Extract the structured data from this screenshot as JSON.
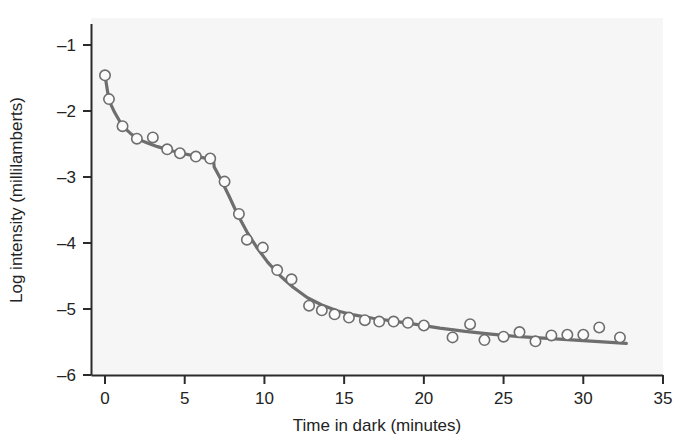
{
  "chart_data": {
    "type": "scatter",
    "title": "",
    "subtitle": "",
    "xlabel": "Time in dark (minutes)",
    "ylabel": "Log intensity (millilamberts)",
    "xlim": [
      0,
      35
    ],
    "ylim": [
      -6,
      -0.6
    ],
    "xticks": [
      0,
      5,
      10,
      15,
      20,
      25,
      30,
      35
    ],
    "xtick_labels": [
      "0",
      "5",
      "10",
      "15",
      "20",
      "25",
      "30",
      "35"
    ],
    "yticks": [
      -1,
      -2,
      -3,
      -4,
      -5,
      -6
    ],
    "ytick_labels": [
      "–1",
      "–2",
      "–3",
      "–4",
      "–5",
      "–6"
    ],
    "grid": false,
    "legend": null,
    "legend_position": "none",
    "annotations": [],
    "series": [
      {
        "name": "Measured threshold",
        "marker": "open-circle",
        "color": "#6e6e6e",
        "points": [
          {
            "x": 0.0,
            "y": -1.46
          },
          {
            "x": 0.25,
            "y": -1.82
          },
          {
            "x": 1.1,
            "y": -2.23
          },
          {
            "x": 2.0,
            "y": -2.42
          },
          {
            "x": 3.0,
            "y": -2.4
          },
          {
            "x": 3.9,
            "y": -2.58
          },
          {
            "x": 4.7,
            "y": -2.64
          },
          {
            "x": 5.7,
            "y": -2.69
          },
          {
            "x": 6.6,
            "y": -2.72
          },
          {
            "x": 7.5,
            "y": -3.07
          },
          {
            "x": 8.4,
            "y": -3.56
          },
          {
            "x": 8.9,
            "y": -3.95
          },
          {
            "x": 9.9,
            "y": -4.07
          },
          {
            "x": 10.8,
            "y": -4.41
          },
          {
            "x": 11.7,
            "y": -4.55
          },
          {
            "x": 12.8,
            "y": -4.95
          },
          {
            "x": 13.6,
            "y": -5.02
          },
          {
            "x": 14.4,
            "y": -5.08
          },
          {
            "x": 15.3,
            "y": -5.13
          },
          {
            "x": 16.3,
            "y": -5.17
          },
          {
            "x": 17.2,
            "y": -5.19
          },
          {
            "x": 18.1,
            "y": -5.19
          },
          {
            "x": 19.0,
            "y": -5.21
          },
          {
            "x": 20.0,
            "y": -5.25
          },
          {
            "x": 21.8,
            "y": -5.43
          },
          {
            "x": 22.9,
            "y": -5.23
          },
          {
            "x": 23.8,
            "y": -5.47
          },
          {
            "x": 25.0,
            "y": -5.42
          },
          {
            "x": 26.0,
            "y": -5.35
          },
          {
            "x": 27.0,
            "y": -5.49
          },
          {
            "x": 28.0,
            "y": -5.4
          },
          {
            "x": 29.0,
            "y": -5.39
          },
          {
            "x": 30.0,
            "y": -5.39
          },
          {
            "x": 31.0,
            "y": -5.28
          },
          {
            "x": 32.3,
            "y": -5.43
          }
        ]
      },
      {
        "name": "Fitted two-branch curve",
        "marker": "none",
        "color": "#6e6e6e",
        "line_width": 3,
        "points": [
          {
            "x": 0.0,
            "y": -1.46
          },
          {
            "x": 0.25,
            "y": -1.84
          },
          {
            "x": 0.6,
            "y": -2.02
          },
          {
            "x": 1.1,
            "y": -2.23
          },
          {
            "x": 1.6,
            "y": -2.34
          },
          {
            "x": 2.1,
            "y": -2.43
          },
          {
            "x": 2.7,
            "y": -2.49
          },
          {
            "x": 3.3,
            "y": -2.54
          },
          {
            "x": 4.0,
            "y": -2.59
          },
          {
            "x": 4.8,
            "y": -2.64
          },
          {
            "x": 5.6,
            "y": -2.68
          },
          {
            "x": 6.2,
            "y": -2.71
          },
          {
            "x": 6.8,
            "y": -2.73
          },
          {
            "x": 6.85,
            "y": -2.85
          },
          {
            "x": 7.3,
            "y": -3.05
          },
          {
            "x": 7.8,
            "y": -3.3
          },
          {
            "x": 8.3,
            "y": -3.56
          },
          {
            "x": 8.9,
            "y": -3.83
          },
          {
            "x": 9.5,
            "y": -4.06
          },
          {
            "x": 10.2,
            "y": -4.29
          },
          {
            "x": 11.0,
            "y": -4.5
          },
          {
            "x": 11.8,
            "y": -4.67
          },
          {
            "x": 12.7,
            "y": -4.83
          },
          {
            "x": 13.6,
            "y": -4.94
          },
          {
            "x": 14.6,
            "y": -5.03
          },
          {
            "x": 15.6,
            "y": -5.09
          },
          {
            "x": 16.8,
            "y": -5.14
          },
          {
            "x": 18.0,
            "y": -5.18
          },
          {
            "x": 19.4,
            "y": -5.23
          },
          {
            "x": 21.0,
            "y": -5.29
          },
          {
            "x": 22.6,
            "y": -5.34
          },
          {
            "x": 24.2,
            "y": -5.38
          },
          {
            "x": 26.0,
            "y": -5.42
          },
          {
            "x": 28.0,
            "y": -5.45
          },
          {
            "x": 30.0,
            "y": -5.48
          },
          {
            "x": 32.7,
            "y": -5.52
          }
        ]
      }
    ]
  },
  "figure": {
    "plot_background_color": "#f6f6f6",
    "page_background_color": "#ffffff",
    "axis_color": "#2b2b2b",
    "data_color": "#6e6e6e"
  }
}
